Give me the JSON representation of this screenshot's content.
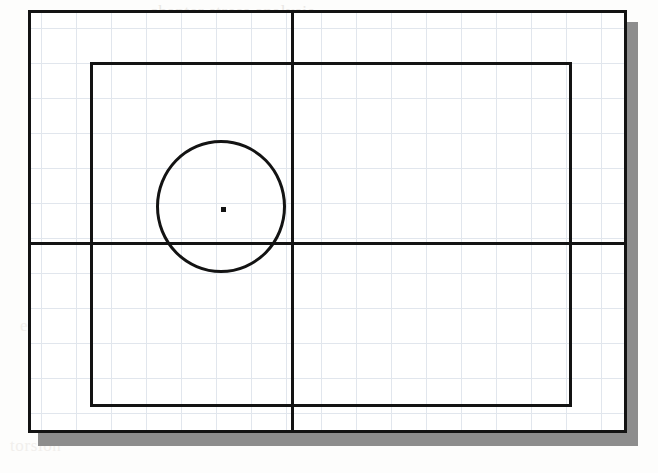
{
  "page": {
    "background_color": "#fdfdfc",
    "width": 658,
    "height": 473
  },
  "figure": {
    "title": "",
    "caption": "",
    "ink_color": "#131313",
    "grid_color": "#b9c6d6",
    "shadow_color": "#8d8d8d",
    "plate_color": "#ffffff",
    "elements": [
      {
        "name": "outer-frame",
        "shape": "rectangle",
        "x": 28,
        "y": 10,
        "width": 599,
        "height": 423
      },
      {
        "name": "drop-shadow",
        "shape": "rectangle",
        "x": 38,
        "y": 22,
        "width": 600,
        "height": 424
      },
      {
        "name": "inner-rectangle",
        "shape": "rectangle",
        "x": 90,
        "y": 62,
        "width": 479,
        "height": 342
      },
      {
        "name": "vertical-axis",
        "shape": "line",
        "x1": 291,
        "y1": 10,
        "x2": 291,
        "y2": 433
      },
      {
        "name": "horizontal-axis",
        "shape": "line",
        "x1": 28,
        "y1": 242,
        "x2": 627,
        "y2": 242
      },
      {
        "name": "circle",
        "shape": "circle",
        "cx": 221,
        "cy": 206,
        "rx": 65,
        "ry": 66
      },
      {
        "name": "center-mark",
        "shape": "point",
        "cx": 221,
        "cy": 206,
        "size": 5
      }
    ],
    "grid": {
      "spacing_px": 35,
      "origin_x": 41,
      "origin_y": 28,
      "style": "dotted"
    }
  },
  "bleed_through": {
    "note": "faint ink showing through from the reverse side of the page",
    "lines": [
      {
        "text": "chapter stress analysis",
        "x": 150,
        "y": 2
      },
      {
        "text": "discussion of mirror plane",
        "x": 40,
        "y": 36
      },
      {
        "text": "the radius",
        "x": 120,
        "y": 84
      },
      {
        "text": "about the centre of",
        "x": 190,
        "y": 186
      },
      {
        "text": "the section is",
        "x": 60,
        "y": 206
      },
      {
        "text": "shear centre",
        "x": 300,
        "y": 210
      },
      {
        "text": "example",
        "x": 20,
        "y": 316
      },
      {
        "text": "of the cross",
        "x": 330,
        "y": 318
      },
      {
        "text": "torsion",
        "x": 10,
        "y": 436
      }
    ]
  }
}
